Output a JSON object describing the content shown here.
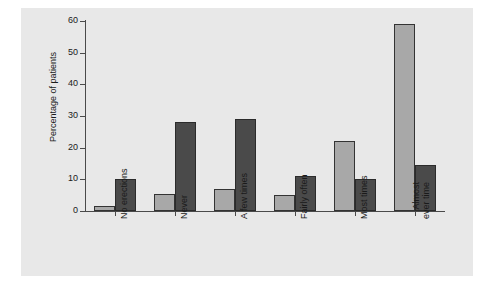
{
  "chart_data": {
    "type": "bar",
    "title": "",
    "subtitle": "",
    "xlabel": "",
    "ylabel": "Percentage of patients",
    "ylim": [
      0,
      60
    ],
    "yticks": [
      0,
      10,
      20,
      30,
      40,
      50,
      60
    ],
    "ytick_labels": [
      "0",
      "10",
      "20",
      "30",
      "40",
      "50",
      "60"
    ],
    "grid": false,
    "legend": "none",
    "categories": [
      "No erections",
      "Never",
      "A few times",
      "Fairly often",
      "Most times",
      "Almost\never time"
    ],
    "category_labels": [
      "No erections",
      "Never",
      "A few times",
      "Fairly often",
      "Most times",
      "Almost every time"
    ],
    "series": [
      {
        "name": "Series 1",
        "color": "#a8a8a8",
        "values": [
          1.5,
          5.5,
          7,
          5,
          22,
          59
        ]
      },
      {
        "name": "Series 2",
        "color": "#4a4a4a",
        "values": [
          10,
          28,
          29,
          11,
          10,
          14.5
        ]
      }
    ],
    "colors": {
      "panel_background": "#e8e8e8",
      "figure_background": "#ffffff",
      "axis": "#4a4a4a",
      "text": "#1a1a1a",
      "bar_light": "#a8a8a8",
      "bar_dark": "#4a4a4a"
    }
  }
}
